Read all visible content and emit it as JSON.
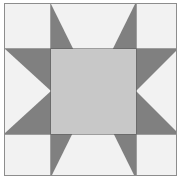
{
  "artwork": {
    "kind": "quilt-block-diagram",
    "name": "Sawtooth Star quilt block",
    "alt_names": [
      "Variable Star",
      "Ohio Star variant",
      "Evening Star"
    ],
    "canvas": {
      "width_px": 182,
      "height_px": 183,
      "background": "#ffffff"
    },
    "frame": {
      "border_color": "#8d8d8d",
      "border_width_px": 1,
      "x_px": 4,
      "y_px": 3,
      "width_px": 173,
      "height_px": 173
    },
    "palette": {
      "light": "#f2f2f2",
      "medium": "#c8c8c8",
      "dark": "#808080",
      "seam": "#5a5a5a"
    },
    "grid": {
      "rows": 3,
      "columns": 3,
      "column_widths_px": [
        46,
        85,
        42
      ],
      "row_heights_px": [
        45,
        85,
        43
      ],
      "vertical_divisions_px": [
        50,
        136
      ],
      "horizontal_divisions_px": [
        48,
        134
      ]
    },
    "patches": [
      {
        "position": "top-left",
        "type": "plain-square",
        "fill": "light",
        "label": "corner"
      },
      {
        "position": "top-center",
        "type": "flying-geese",
        "fill": "dark",
        "triangle": "light",
        "apex": "down",
        "label": "star point"
      },
      {
        "position": "top-right",
        "type": "plain-square",
        "fill": "light",
        "label": "corner"
      },
      {
        "position": "middle-left",
        "type": "flying-geese",
        "fill": "dark",
        "triangle": "light",
        "apex": "right",
        "label": "star point"
      },
      {
        "position": "center",
        "type": "plain-square",
        "fill": "medium",
        "label": "center square"
      },
      {
        "position": "middle-right",
        "type": "flying-geese",
        "fill": "dark",
        "triangle": "light",
        "apex": "left",
        "label": "star point"
      },
      {
        "position": "bottom-left",
        "type": "plain-square",
        "fill": "light",
        "label": "corner"
      },
      {
        "position": "bottom-center",
        "type": "flying-geese",
        "fill": "dark",
        "triangle": "light",
        "apex": "up",
        "label": "star point"
      },
      {
        "position": "bottom-right",
        "type": "plain-square",
        "fill": "light",
        "label": "corner"
      }
    ]
  }
}
